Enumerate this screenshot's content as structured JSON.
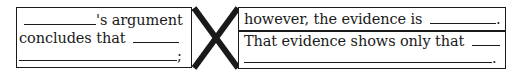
{
  "diagram": {
    "type": "argument-template-organizer",
    "left_box": {
      "lines": [
        {
          "blank_before": true,
          "text": "'s argument"
        },
        {
          "text": "concludes that",
          "blank_after": true
        },
        {
          "blank_full": true,
          "end_punct": ";"
        }
      ]
    },
    "connector": {
      "shape": "x-cross",
      "color": "#1a1a1a"
    },
    "right_box": {
      "top_section": {
        "text": "however, the evidence is",
        "blank_after": true,
        "end_punct": "."
      },
      "bottom_section": {
        "lines": [
          {
            "text": "That evidence shows only that",
            "blank_after": true
          },
          {
            "blank_full": true,
            "end_punct": "."
          }
        ]
      }
    },
    "colors": {
      "ink": "#1a1a1a",
      "background": "#ffffff"
    }
  }
}
